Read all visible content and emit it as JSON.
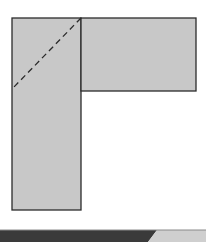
{
  "diagram": {
    "type": "geometry-figure",
    "colors": {
      "fill": "#c8c8c8",
      "stroke": "#2b2b2b",
      "background": "#ffffff",
      "bar_dark": "#3a3a3a",
      "bar_light": "#cfcfcf"
    },
    "shapes": [
      {
        "id": "vertical-rectangle",
        "x": 12,
        "y": 18,
        "width": 69,
        "height": 192
      },
      {
        "id": "horizontal-rectangle",
        "x": 81,
        "y": 18,
        "width": 115,
        "height": 73
      }
    ],
    "dashed_line": {
      "x1": 81,
      "y1": 18,
      "x2": 12,
      "y2": 89,
      "dash": "6 4"
    },
    "bottom_bar": {
      "y": 230,
      "height": 12,
      "split_x_top": 157,
      "split_x_bottom": 148
    }
  }
}
